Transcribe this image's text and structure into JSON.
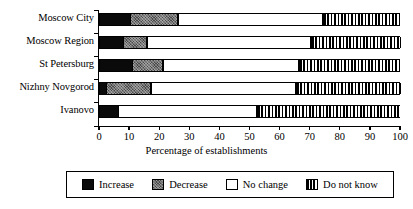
{
  "chart_data": {
    "type": "bar",
    "orientation": "horizontal",
    "stacked": true,
    "title": "",
    "xlabel": "Percentage of establishments",
    "ylabel": "",
    "xlim": [
      0,
      100
    ],
    "xticks": [
      0,
      10,
      20,
      30,
      40,
      50,
      60,
      70,
      80,
      90,
      100
    ],
    "xtick_labels": [
      "0",
      "10",
      "20",
      "30",
      "40",
      "50",
      "60",
      "70",
      "80",
      "90",
      "100"
    ],
    "grid": false,
    "legend_position": "bottom",
    "categories": [
      "Moscow City",
      "Moscow Region",
      "St Petersburg",
      "Nizhny Novgorod",
      "Ivanovo"
    ],
    "series": [
      {
        "name": "Increase",
        "values": [
          10.0,
          7.5,
          10.5,
          2.0,
          6.0
        ]
      },
      {
        "name": "Decrease",
        "values": [
          16.0,
          8.0,
          10.5,
          15.0,
          0.0
        ]
      },
      {
        "name": "No change",
        "values": [
          48.0,
          54.5,
          45.0,
          48.0,
          46.0
        ]
      },
      {
        "name": "Do not know",
        "values": [
          26.0,
          30.0,
          34.0,
          35.0,
          48.0
        ]
      }
    ],
    "cumulative_boundaries": {
      "Moscow City": [
        10.0,
        26.0,
        74.0,
        100.0
      ],
      "Moscow Region": [
        7.5,
        15.5,
        70.0,
        100.0
      ],
      "St Petersburg": [
        10.5,
        21.0,
        66.0,
        100.0
      ],
      "Nizhny Novgorod": [
        2.0,
        17.0,
        65.0,
        100.0
      ],
      "Ivanovo": [
        6.0,
        6.0,
        52.0,
        100.0
      ]
    }
  },
  "axis": {
    "x_title": "Percentage of establishments",
    "tick_labels": [
      "0",
      "10",
      "20",
      "30",
      "40",
      "50",
      "60",
      "70",
      "80",
      "90",
      "100"
    ],
    "category_labels": [
      "Moscow City",
      "Moscow Region",
      "St Petersburg",
      "Nizhny Novgorod",
      "Ivanovo"
    ]
  },
  "legend": {
    "entries": [
      {
        "label": "Increase",
        "swatch": "solid-black",
        "color": "#0a0a0a"
      },
      {
        "label": "Decrease",
        "swatch": "speckled-gray",
        "color": "#4a4a4a"
      },
      {
        "label": "No change",
        "swatch": "white-outline",
        "color": "#ffffff"
      },
      {
        "label": "Do not know",
        "swatch": "vertical-stripes",
        "color": "#000000"
      }
    ]
  },
  "colors": {
    "axis": "#000000",
    "background": "#ffffff",
    "increase": "#0a0a0a",
    "decrease": "#4a4a4a",
    "no_change": "#ffffff",
    "do_not_know": "#000000"
  }
}
